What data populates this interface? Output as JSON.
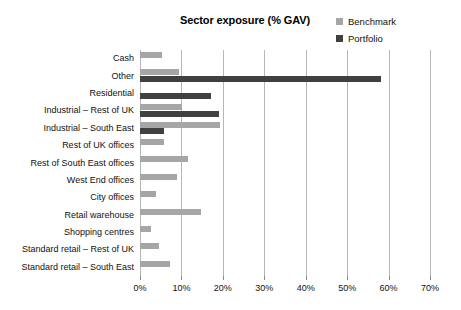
{
  "chart_data": {
    "type": "bar",
    "orientation": "horizontal",
    "title": "Sector exposure (% GAV)",
    "xlabel": "",
    "ylabel": "",
    "xlim": [
      0,
      70
    ],
    "xticks": [
      "0%",
      "10%",
      "20%",
      "30%",
      "40%",
      "50%",
      "60%",
      "70%"
    ],
    "xtick_values": [
      0,
      10,
      20,
      30,
      40,
      50,
      60,
      70
    ],
    "grid": true,
    "legend_position": "top-right",
    "categories": [
      "Cash",
      "Other",
      "Residential",
      "Industrial – Rest of UK",
      "Industrial – South East",
      "Rest of UK offices",
      "Rest of South East offices",
      "West End offices",
      "City offices",
      "Retail warehouse",
      "Shopping centres",
      "Standard retail – Rest of UK",
      "Standard retail – South East"
    ],
    "series": [
      {
        "name": "Benchmark",
        "color": "#a6a6a6",
        "values": [
          5.3,
          9.4,
          0.0,
          10.1,
          19.3,
          5.8,
          11.6,
          8.9,
          3.9,
          14.7,
          2.7,
          4.6,
          7.2
        ]
      },
      {
        "name": "Portfolio",
        "color": "#404040",
        "values": [
          0.0,
          58.2,
          17.2,
          19.1,
          5.8,
          0.0,
          0.0,
          0.0,
          0.0,
          0.0,
          0.0,
          0.0,
          0.0
        ]
      }
    ]
  },
  "legend": {
    "items": [
      {
        "label": "Benchmark",
        "color": "#a6a6a6"
      },
      {
        "label": "Portfolio",
        "color": "#404040"
      }
    ]
  }
}
